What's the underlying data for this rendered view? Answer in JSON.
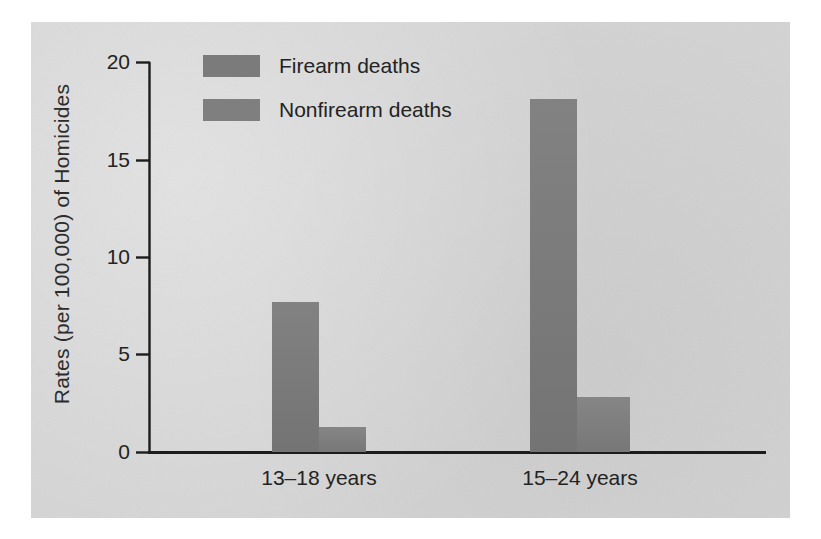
{
  "chart_data": {
    "type": "bar",
    "title": "",
    "subtitle": "",
    "xlabel": "",
    "ylabel": "Rates (per 100,000) of Homicides",
    "categories": [
      "13–18 years",
      "15–24 years"
    ],
    "series": [
      {
        "name": "Firearm deaths",
        "values": [
          7.7,
          18.1
        ],
        "color": "#7b7b7b"
      },
      {
        "name": "Nonfirearm deaths",
        "values": [
          1.3,
          2.8
        ],
        "color": "#7f7f7f"
      }
    ],
    "ylim": [
      0,
      20
    ],
    "yticks": [
      0,
      5,
      10,
      15,
      20
    ],
    "ytick_labels": [
      "0",
      "5",
      "10",
      "15",
      "20"
    ],
    "grid": false,
    "legend_position": "top-left-inside",
    "legend_entries": [
      "Firearm deaths",
      "Nonfirearm deaths"
    ],
    "axis_color": "#1c1c1c",
    "panel_background": "#d3d3d3",
    "figure_background": "#ffffff"
  },
  "axis": {
    "y_title": "Rates (per 100,000) of Homicides",
    "tick_20": "20",
    "tick_15": "15",
    "tick_10": "10",
    "tick_5": "5",
    "tick_0": "0",
    "cat_1": "13–18 years",
    "cat_2": "15–24 years"
  },
  "legend": {
    "item_1": "Firearm deaths",
    "item_2": "Nonfirearm deaths"
  }
}
